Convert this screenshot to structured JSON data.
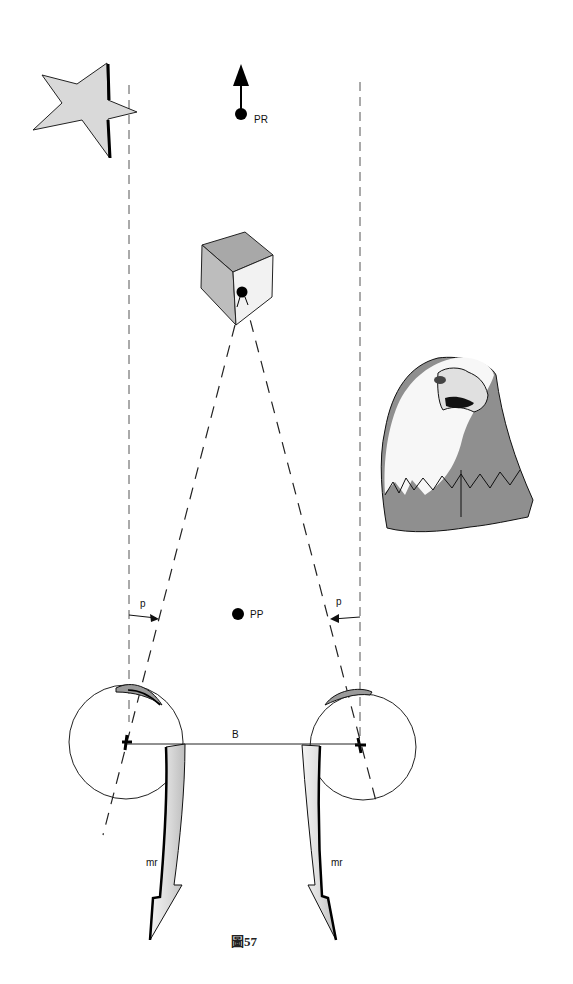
{
  "figure": {
    "caption": "圖57",
    "labels": {
      "pr": "PR",
      "pp": "PP",
      "p_left": "p",
      "p_right": "p",
      "baseline": "B",
      "mr_left": "mr",
      "mr_right": "mr"
    },
    "objects": {
      "star": "star-shape",
      "cube": "cube-with-dot",
      "eagle": "eagle-head"
    },
    "colors": {
      "line": "#1a1a1a",
      "dash": "#333333",
      "fill_light": "#dcdcdc",
      "fill_mid": "#9a9a9a",
      "background": "#ffffff"
    }
  }
}
